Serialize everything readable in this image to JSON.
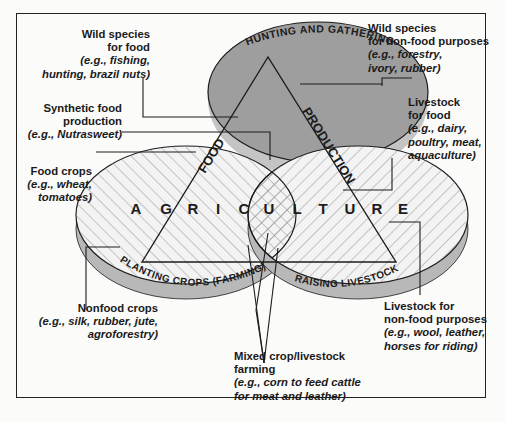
{
  "diagram": {
    "circles": {
      "top": {
        "label": "HUNTING AND GATHERING",
        "fill": "#9e9e9e"
      },
      "left": {
        "label": "PLANTING CROPS (FARMING)",
        "fill": "#f1f1f1",
        "rim": "#b8b8b8"
      },
      "right": {
        "label": "RAISING LIVESTOCK",
        "fill": "#f1f1f1",
        "rim": "#b8b8b8"
      }
    },
    "triangle": {
      "left_side": "FOOD",
      "right_side": "PRODUCTION",
      "base_letters": [
        "A",
        "G",
        "R",
        "I",
        "C",
        "U",
        "L",
        "T",
        "U",
        "R",
        "E"
      ]
    },
    "labels": {
      "wild_food": {
        "heading": [
          "Wild species",
          "for food"
        ],
        "example": [
          "(e.g., fishing,",
          "hunting, brazil nuts)"
        ]
      },
      "wild_nonfood": {
        "heading": [
          "Wild species",
          "for non-food purposes"
        ],
        "example": [
          "(e.g., forestry,",
          "ivory, rubber)"
        ]
      },
      "synthetic": {
        "heading": [
          "Synthetic food",
          "production"
        ],
        "example": [
          "(e.g., Nutrasweet)"
        ]
      },
      "livestock_food": {
        "heading": [
          "Livestock",
          "for food"
        ],
        "example": [
          "(e.g., dairy,",
          "poultry, meat,",
          "aquaculture)"
        ]
      },
      "food_crops": {
        "heading": [
          "Food crops"
        ],
        "example": [
          "(e.g., wheat,",
          "tomatoes)"
        ]
      },
      "nonfood_crops": {
        "heading": [
          "Nonfood crops"
        ],
        "example": [
          "(e.g., silk, rubber, jute,",
          "agroforestry)"
        ]
      },
      "livestock_nonfood": {
        "heading": [
          "Livestock for",
          "non-food purposes"
        ],
        "example": [
          "(e.g., wool, leather,",
          "horses for riding)"
        ]
      },
      "mixed": {
        "heading": [
          "Mixed crop/livestock",
          "farming"
        ],
        "example": [
          "(e.g., corn to feed cattle",
          "for meat and leather)"
        ]
      }
    },
    "colors": {
      "line": "#1c1c1c",
      "hatch": "#8a8a8a",
      "background": "#fbfbfa"
    }
  }
}
